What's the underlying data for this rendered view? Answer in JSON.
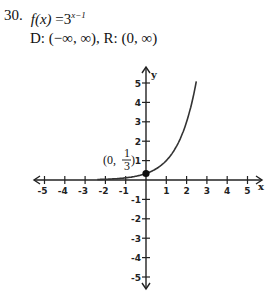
{
  "problem": {
    "number": "30.",
    "function_lhs": "f(x)",
    "function_eq": "=",
    "function_base": "3",
    "function_exponent": "x−1",
    "domain_label": "D:",
    "domain_value": "(−∞, ∞),",
    "range_label": "R:",
    "range_value": "(0, ∞)"
  },
  "chart_data": {
    "type": "line",
    "xlabel": "x",
    "ylabel": "y",
    "xlim": [
      -5,
      5
    ],
    "ylim": [
      -5,
      5
    ],
    "x_ticks": [
      -5,
      -4,
      -3,
      -2,
      -1,
      1,
      2,
      3,
      4,
      5
    ],
    "y_ticks": [
      -5,
      -4,
      -3,
      -2,
      -1,
      1,
      2,
      3,
      4,
      5
    ],
    "grid": false,
    "series": [
      {
        "name": "f(x) = 3^(x-1)",
        "x": [
          -2.5,
          -2,
          -1.5,
          -1,
          -0.5,
          0,
          0.5,
          1,
          1.5,
          2,
          2.5
        ],
        "y": [
          0.014,
          0.037,
          0.064,
          0.111,
          0.192,
          0.333,
          0.577,
          1,
          1.732,
          3,
          5.196
        ]
      }
    ],
    "annotations": [
      {
        "point": [
          0,
          0.333
        ],
        "label": "(0, 1/3)",
        "marker": "filled-dot"
      }
    ]
  },
  "labels": {
    "point_open": "(0,",
    "point_num": "1",
    "point_den": "3",
    "point_close": ")",
    "x_axis": "x",
    "y_axis": "y",
    "x_ticks": [
      "-5",
      "-4",
      "-3",
      "-2",
      "-1",
      "1",
      "2",
      "3",
      "4",
      "5"
    ],
    "y_ticks": [
      "5",
      "4",
      "3",
      "2",
      "1",
      "-1",
      "-2",
      "-3",
      "-4",
      "-5"
    ]
  }
}
